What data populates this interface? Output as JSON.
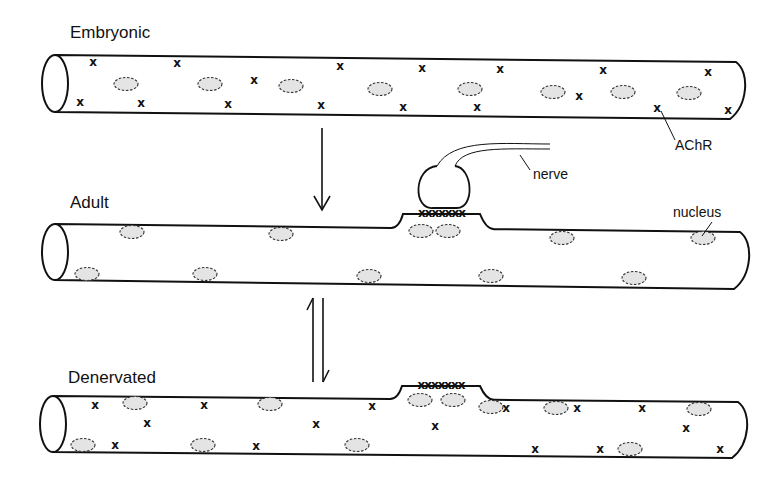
{
  "stages": [
    {
      "id": "embryonic",
      "label": "Embryonic",
      "label_pos": [
        70,
        38
      ],
      "fiber": {
        "x1": 55,
        "y_top": 55,
        "y_bot": 112,
        "x2": 736,
        "y_top_right": 62,
        "y_bot_right": 119
      },
      "nuclei": [
        [
          126,
          84
        ],
        [
          210,
          84
        ],
        [
          291,
          86
        ],
        [
          380,
          89
        ],
        [
          470,
          89
        ],
        [
          553,
          92
        ],
        [
          623,
          92
        ],
        [
          689,
          93
        ]
      ],
      "achr": [
        [
          93,
          62
        ],
        [
          177,
          63
        ],
        [
          340,
          66
        ],
        [
          422,
          68
        ],
        [
          500,
          69
        ],
        [
          603,
          70
        ],
        [
          708,
          72
        ],
        [
          80,
          102
        ],
        [
          141,
          103
        ],
        [
          228,
          104
        ],
        [
          321,
          105
        ],
        [
          403,
          107
        ],
        [
          477,
          107
        ],
        [
          579,
          96
        ],
        [
          657,
          108
        ],
        [
          728,
          110
        ],
        [
          254,
          80
        ]
      ]
    },
    {
      "id": "adult",
      "label": "Adult",
      "label_pos": [
        70,
        208
      ],
      "fiber": {
        "x1": 55,
        "y_top": 224,
        "y_bot": 280,
        "x2": 740,
        "y_top_right": 232,
        "y_bot_right": 289
      },
      "nuclei": [
        [
          132,
          232
        ],
        [
          281,
          234
        ],
        [
          87,
          274
        ],
        [
          205,
          274
        ],
        [
          369,
          276
        ],
        [
          421,
          231
        ],
        [
          448,
          231
        ],
        [
          562,
          238
        ],
        [
          703,
          238
        ],
        [
          491,
          276
        ],
        [
          634,
          278
        ]
      ],
      "endplate": {
        "x_start": 403,
        "x_end": 480,
        "y_base": 226,
        "y_top": 214,
        "label": "xxxxxxx"
      },
      "achr": []
    },
    {
      "id": "denervated",
      "label": "Denervated",
      "label_pos": [
        68,
        383
      ],
      "fiber": {
        "x1": 53,
        "y_top": 396,
        "y_bot": 452,
        "x2": 738,
        "y_top_right": 402,
        "y_bot_right": 458
      },
      "nuclei": [
        [
          135,
          403
        ],
        [
          270,
          404
        ],
        [
          83,
          445
        ],
        [
          203,
          445
        ],
        [
          357,
          445
        ],
        [
          420,
          400
        ],
        [
          453,
          400
        ],
        [
          491,
          407
        ],
        [
          556,
          408
        ],
        [
          630,
          449
        ],
        [
          699,
          409
        ]
      ],
      "endplate": {
        "x_start": 402,
        "x_end": 480,
        "y_base": 397,
        "y_top": 386,
        "label": "xxxxxxx"
      },
      "achr": [
        [
          95,
          405
        ],
        [
          147,
          423
        ],
        [
          204,
          405
        ],
        [
          115,
          445
        ],
        [
          256,
          446
        ],
        [
          316,
          424
        ],
        [
          372,
          406
        ],
        [
          435,
          426
        ],
        [
          506,
          408
        ],
        [
          535,
          449
        ],
        [
          577,
          408
        ],
        [
          600,
          449
        ],
        [
          642,
          408
        ],
        [
          686,
          428
        ],
        [
          720,
          449
        ]
      ]
    }
  ],
  "transitions": [
    {
      "id": "embryonic-to-adult",
      "type": "single-down-arrow",
      "x": 322,
      "y1": 128,
      "y2": 210
    },
    {
      "id": "adult-denervated",
      "type": "equilibrium-arrows",
      "x": 318,
      "y1": 298,
      "y2": 382
    }
  ],
  "callouts": {
    "achr": {
      "label": "AChR",
      "label_pos": [
        675,
        150
      ],
      "from": [
        661,
        111
      ],
      "to": [
        675,
        140
      ]
    },
    "nerve": {
      "label": "nerve",
      "label_pos": [
        533,
        179
      ],
      "from": [
        520,
        155
      ],
      "to": [
        530,
        170
      ]
    },
    "nucleus": {
      "label": "nucleus",
      "label_pos": [
        673,
        217
      ],
      "from": [
        712,
        222
      ],
      "to": [
        702,
        236
      ]
    }
  },
  "nerve_terminal": {
    "cx": 443,
    "top_y": 178,
    "bottom_y": 208,
    "axon_end_x": 550,
    "axon_end_y": 146
  }
}
